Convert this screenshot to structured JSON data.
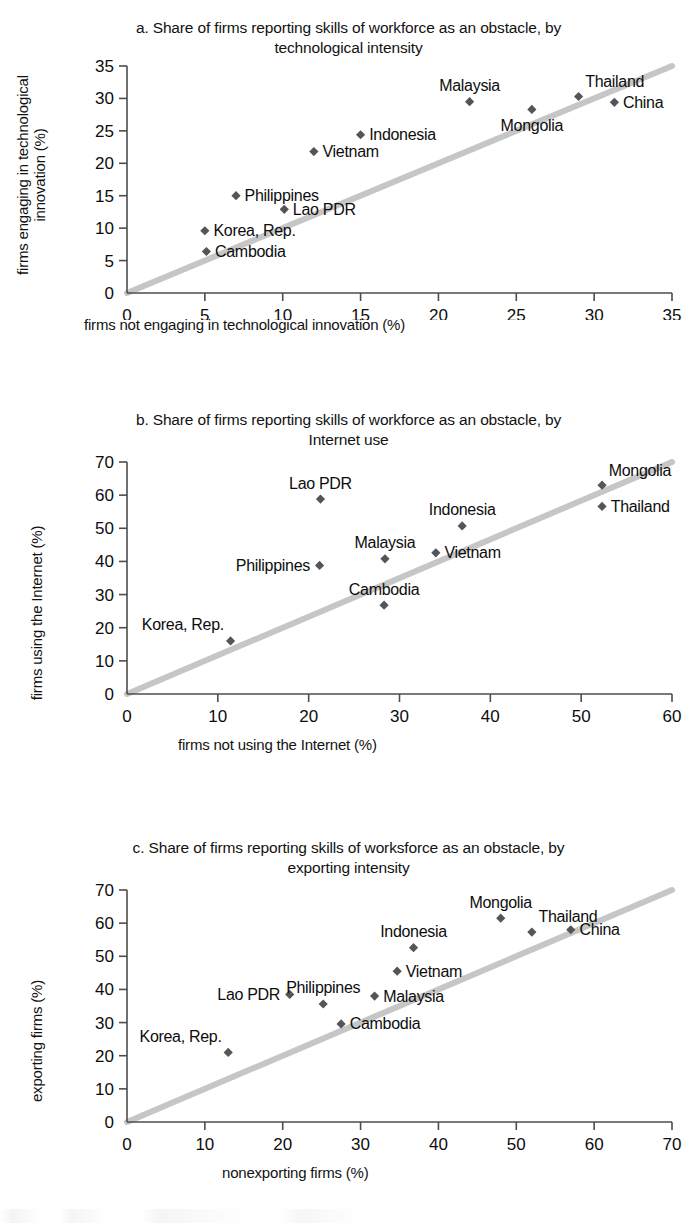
{
  "figure": {
    "marker_color": "#54545a",
    "trendline_color": "#c6c6c6",
    "axis_color": "#4d4d4d"
  },
  "chart_data": [
    {
      "id": "a",
      "type": "scatter",
      "title": "a. Share of firms reporting skills of workforce as an obstacle, by technological intensity",
      "title_line1": "a. Share of firms reporting skills of workforce as an obstacle, by",
      "title_line2": "technological intensity",
      "xlabel": "firms not engaging in technological innovation (%)",
      "ylabel": "firms engaging in technological innovation (%)",
      "ylabel_line1": "firms engaging in technological",
      "ylabel_line2": "innovation (%)",
      "xlim": [
        0,
        35
      ],
      "ylim": [
        0,
        35
      ],
      "xticks": [
        0,
        5,
        10,
        15,
        20,
        25,
        30,
        35
      ],
      "yticks": [
        0,
        5,
        10,
        15,
        20,
        25,
        30,
        35
      ],
      "grid": false,
      "legend": "none",
      "reference_line": {
        "label": "45-degree line",
        "from": [
          0,
          0
        ],
        "to": [
          35,
          35
        ]
      },
      "points": [
        {
          "label": "Cambodia",
          "x": 5.1,
          "y": 6.4,
          "label_pos": "right"
        },
        {
          "label": "Korea, Rep.",
          "x": 5.0,
          "y": 9.6,
          "label_pos": "right"
        },
        {
          "label": "Philippines",
          "x": 7.0,
          "y": 15.0,
          "label_pos": "right"
        },
        {
          "label": "Lao PDR",
          "x": 10.1,
          "y": 12.9,
          "label_pos": "right"
        },
        {
          "label": "Vietnam",
          "x": 12.0,
          "y": 21.8,
          "label_pos": "right"
        },
        {
          "label": "Indonesia",
          "x": 15.0,
          "y": 24.4,
          "label_pos": "right"
        },
        {
          "label": "Malaysia",
          "x": 22.0,
          "y": 29.5,
          "label_pos": "above"
        },
        {
          "label": "Mongolia",
          "x": 26.0,
          "y": 28.3,
          "label_pos": "below"
        },
        {
          "label": "Thailand",
          "x": 29.0,
          "y": 30.3,
          "label_pos": "above-right"
        },
        {
          "label": "China",
          "x": 31.3,
          "y": 29.4,
          "label_pos": "right"
        }
      ]
    },
    {
      "id": "b",
      "type": "scatter",
      "title": "b. Share of firms reporting skills of workforce as an obstacle, by Internet use",
      "title_line1": "b. Share of firms reporting skills of workforce as an obstacle, by",
      "title_line2": "Internet use",
      "xlabel": "firms not using the Internet (%)",
      "ylabel": "firms using the Internet (%)",
      "xlim": [
        0,
        60
      ],
      "ylim": [
        0,
        70
      ],
      "xticks": [
        0,
        10,
        20,
        30,
        40,
        50,
        60
      ],
      "yticks": [
        0,
        10,
        20,
        30,
        40,
        50,
        60,
        70
      ],
      "grid": false,
      "legend": "none",
      "reference_line": {
        "label": "45-degree line",
        "from": [
          0,
          0
        ],
        "to": [
          60,
          70
        ]
      },
      "points": [
        {
          "label": "Korea, Rep.",
          "x": 11.4,
          "y": 16.0,
          "label_pos": "above-left"
        },
        {
          "label": "Philippines",
          "x": 21.2,
          "y": 38.8,
          "label_pos": "left"
        },
        {
          "label": "Lao PDR",
          "x": 21.3,
          "y": 58.8,
          "label_pos": "above"
        },
        {
          "label": "Cambodia",
          "x": 28.3,
          "y": 26.8,
          "label_pos": "above"
        },
        {
          "label": "Malaysia",
          "x": 28.4,
          "y": 40.8,
          "label_pos": "above"
        },
        {
          "label": "Vietnam",
          "x": 34.0,
          "y": 42.6,
          "label_pos": "right"
        },
        {
          "label": "Indonesia",
          "x": 36.9,
          "y": 50.7,
          "label_pos": "above"
        },
        {
          "label": "Mongolia",
          "x": 52.3,
          "y": 63.0,
          "label_pos": "above-right"
        },
        {
          "label": "Thailand",
          "x": 52.3,
          "y": 56.6,
          "label_pos": "right"
        }
      ]
    },
    {
      "id": "c",
      "type": "scatter",
      "title": "c. Share of firms reporting skills of worksforce as an obstacle, by exporting intensity",
      "title_line1": "c. Share of firms reporting skills of worksforce as an obstacle, by",
      "title_line2": "exporting intensity",
      "xlabel": "nonexporting firms (%)",
      "ylabel": "exporting firms (%)",
      "xlim": [
        0,
        70
      ],
      "ylim": [
        0,
        70
      ],
      "xticks": [
        0,
        10,
        20,
        30,
        40,
        50,
        60,
        70
      ],
      "yticks": [
        0,
        10,
        20,
        30,
        40,
        50,
        60,
        70
      ],
      "grid": false,
      "legend": "none",
      "reference_line": {
        "label": "45-degree line",
        "from": [
          0,
          0
        ],
        "to": [
          70,
          70
        ]
      },
      "points": [
        {
          "label": "Korea, Rep.",
          "x": 13.0,
          "y": 21.0,
          "label_pos": "above-left"
        },
        {
          "label": "Lao PDR",
          "x": 20.9,
          "y": 38.5,
          "label_pos": "left"
        },
        {
          "label": "Philippines",
          "x": 25.2,
          "y": 35.6,
          "label_pos": "above"
        },
        {
          "label": "Cambodia",
          "x": 27.5,
          "y": 29.6,
          "label_pos": "right"
        },
        {
          "label": "Malaysia",
          "x": 31.8,
          "y": 38.0,
          "label_pos": "right"
        },
        {
          "label": "Vietnam",
          "x": 34.7,
          "y": 45.5,
          "label_pos": "right"
        },
        {
          "label": "Indonesia",
          "x": 36.8,
          "y": 52.6,
          "label_pos": "above"
        },
        {
          "label": "Mongolia",
          "x": 48.0,
          "y": 61.5,
          "label_pos": "above"
        },
        {
          "label": "Thailand",
          "x": 52.0,
          "y": 57.3,
          "label_pos": "above-right"
        },
        {
          "label": "China",
          "x": 57.0,
          "y": 58.0,
          "label_pos": "right"
        }
      ]
    }
  ]
}
